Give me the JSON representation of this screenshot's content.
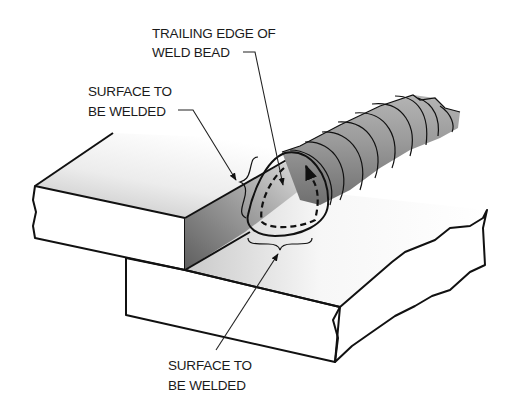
{
  "figure": {
    "labels": {
      "trailing_edge_line1": "TRAILING EDGE OF",
      "trailing_edge_line2": "WELD BEAD",
      "surface_upper_line1": "SURFACE TO",
      "surface_upper_line2": "BE WELDED",
      "surface_lower_line1": "SURFACE TO",
      "surface_lower_line2": "BE WELDED"
    },
    "components": [
      {
        "name": "upper-plate",
        "description": "Top plate of lap joint"
      },
      {
        "name": "lower-plate",
        "description": "Bottom plate of lap joint"
      },
      {
        "name": "weld-bead",
        "description": "Rippled weld bead along joint"
      },
      {
        "name": "trailing-edge-puddle",
        "description": "Trailing edge with dashed circular motion path and arrow"
      }
    ],
    "colors": {
      "background": "#ffffff",
      "outline": "#111111",
      "plate_light": "#f4f4f4",
      "plate_mid": "#c8c8c8",
      "plate_dark": "#7a7a7a",
      "bead_light": "#a8a8a8",
      "bead_dark": "#6e6e6e",
      "puddle": "#d2d2d2"
    }
  }
}
